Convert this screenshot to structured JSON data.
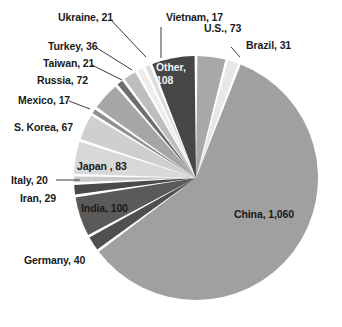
{
  "chart_data": {
    "type": "pie",
    "title": "",
    "subtitle": "",
    "xlabel": "",
    "ylabel": "",
    "legend_position": "none",
    "grid": false,
    "total": 1695,
    "start_angle_deg": 0,
    "direction": "clockwise",
    "categories": [
      "U.S.",
      "Brazil",
      "China",
      "Germany",
      "India",
      "Iran",
      "Italy",
      "Japan",
      "S. Korea",
      "Mexico",
      "Russia",
      "Taiwan",
      "Turkey",
      "Ukraine",
      "Vietnam",
      "Other"
    ],
    "values": [
      73,
      31,
      1060,
      40,
      100,
      29,
      20,
      83,
      67,
      17,
      72,
      21,
      36,
      21,
      17,
      108
    ],
    "slices": [
      {
        "name": "U.S.",
        "value": 73,
        "label": "U.S., 73",
        "color": "#a8a8a8",
        "label_placement": "outside"
      },
      {
        "name": "Brazil",
        "value": 31,
        "label": "Brazil, 31",
        "color": "#e8e8e8",
        "label_placement": "outside"
      },
      {
        "name": "China",
        "value": 1060,
        "label": "China, 1,060",
        "color": "#a0a0a0",
        "label_placement": "inside"
      },
      {
        "name": "Germany",
        "value": 40,
        "label": "Germany, 40",
        "color": "#4f4f4f",
        "label_placement": "outside"
      },
      {
        "name": "India",
        "value": 100,
        "label": "India, 100",
        "color": "#5a5a5a",
        "label_placement": "inside"
      },
      {
        "name": "Iran",
        "value": 29,
        "label": "Iran, 29",
        "color": "#4a4a4a",
        "label_placement": "outside"
      },
      {
        "name": "Italy",
        "value": 20,
        "label": "Italy, 20",
        "color": "#c9c9c9",
        "label_placement": "outside"
      },
      {
        "name": "Japan",
        "value": 83,
        "label": "Japan , 83",
        "color": "#d8d8d8",
        "label_placement": "inside"
      },
      {
        "name": "S. Korea",
        "value": 67,
        "label": "S. Korea, 67",
        "color": "#cfcfcf",
        "label_placement": "outside"
      },
      {
        "name": "Mexico",
        "value": 17,
        "label": "Mexico, 17",
        "color": "#8f8f8f",
        "label_placement": "outside"
      },
      {
        "name": "Russia",
        "value": 72,
        "label": "Russia, 72",
        "color": "#a6a6a6",
        "label_placement": "outside"
      },
      {
        "name": "Taiwan",
        "value": 21,
        "label": "Taiwan, 21",
        "color": "#6e6e6e",
        "label_placement": "outside"
      },
      {
        "name": "Turkey",
        "value": 36,
        "label": "Turkey, 36",
        "color": "#bdbdbd",
        "label_placement": "outside"
      },
      {
        "name": "Ukraine",
        "value": 21,
        "label": "Ukraine, 21",
        "color": "#ededed",
        "label_placement": "outside"
      },
      {
        "name": "Vietnam",
        "value": 17,
        "label": "Vietnam, 17",
        "color": "#dcdcdc",
        "label_placement": "outside"
      },
      {
        "name": "Other",
        "value": 108,
        "label_line1": "Other,",
        "label_line2": "108",
        "label": "Other, 108",
        "color": "#464646",
        "label_placement": "inside"
      }
    ]
  },
  "labels": {
    "us": "U.S., 73",
    "brazil": "Brazil, 31",
    "china": "China, 1,060",
    "germany": "Germany, 40",
    "india": "India, 100",
    "iran": "Iran, 29",
    "italy": "Italy, 20",
    "japan": "Japan , 83",
    "skorea": "S. Korea, 67",
    "mexico": "Mexico, 17",
    "russia": "Russia, 72",
    "taiwan": "Taiwan, 21",
    "turkey": "Turkey, 36",
    "ukraine": "Ukraine, 21",
    "vietnam": "Vietnam, 17",
    "other_line1": "Other,",
    "other_line2": "108"
  },
  "colors": {
    "background": "#ffffff",
    "separator": "#ffffff",
    "text_dark": "#1a1a1a",
    "text_light": "#f2f2f2",
    "leader_line": "#3a3a3a"
  }
}
